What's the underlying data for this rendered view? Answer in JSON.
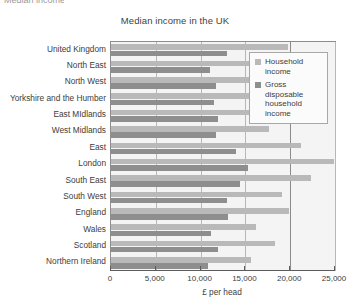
{
  "top_sliver_text": "Median income",
  "chart_data": {
    "type": "bar",
    "orientation": "horizontal",
    "title": "Median income in the UK",
    "xlabel": "£ per head",
    "ylabel": "",
    "xlim": [
      0,
      25000
    ],
    "xticks": [
      0,
      5000,
      10000,
      15000,
      20000,
      25000
    ],
    "xticklabels": [
      "0",
      "5,000",
      "10,000",
      "15,000",
      "20,000",
      "25,000"
    ],
    "grid": "vertical",
    "legend_position": "top-right-inside",
    "categories": [
      "United Kingdom",
      "North East",
      "North West",
      "Yorkshire and the Humber",
      "East MIdlands",
      "West Midlands",
      "East",
      "London",
      "South East",
      "South West",
      "England",
      "Wales",
      "Scotland",
      "Northern Ireland"
    ],
    "series": [
      {
        "name": "Household income",
        "color": "#b9b9b9",
        "values": [
          19800,
          16300,
          17400,
          17200,
          17500,
          17600,
          21200,
          24900,
          22300,
          19100,
          19900,
          16200,
          18300,
          15600
        ]
      },
      {
        "name": "Gross disposable household income",
        "color": "#8e8e8e",
        "values": [
          12900,
          11000,
          11700,
          11500,
          11900,
          11700,
          14000,
          15300,
          14400,
          12900,
          13100,
          11200,
          11900,
          10800
        ]
      }
    ]
  },
  "legend": {
    "entries": [
      {
        "label": "Household income",
        "color": "#b9b9b9"
      },
      {
        "label": "Gross disposable household income",
        "color": "#8e8e8e"
      }
    ]
  },
  "colors": {
    "plot_background": "#f4f4f4",
    "gridline": "#b7b7b7",
    "axis": "#5c5c5c",
    "text": "#3d3d3d"
  }
}
